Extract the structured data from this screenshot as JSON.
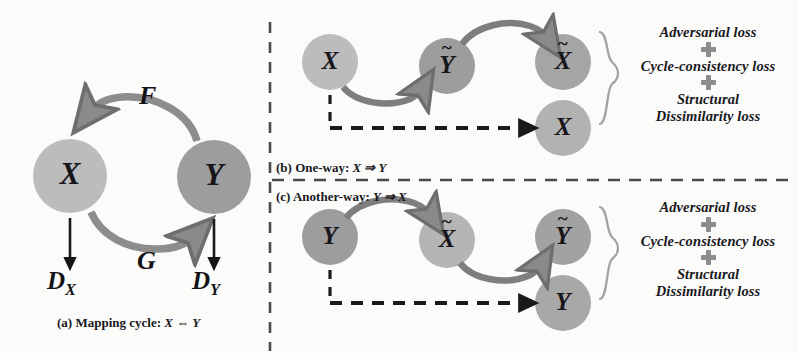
{
  "figure": {
    "background": "#fbfbfa",
    "colors": {
      "node_light": "#b9b9b9",
      "node_dark": "#9a9a9a",
      "arrow_gray": "#8a8a8a",
      "arrow_dark": "#6f6f6f",
      "text": "#18181c",
      "dash_black": "#1a1a1a",
      "plus_gray": "#8c8c8c",
      "brace_gray": "#9c9c9c"
    }
  },
  "panel_a": {
    "caption": "(a) Mapping cycle: ",
    "caption_math": "X ⇔ Y",
    "nodes": [
      {
        "id": "a-x",
        "label": "X",
        "tone": "light",
        "cx": 70,
        "cy": 176,
        "r": 37
      },
      {
        "id": "a-y",
        "label": "Y",
        "tone": "dark",
        "cx": 214,
        "cy": 177,
        "r": 37
      }
    ],
    "mappings": [
      {
        "id": "F",
        "label": "F",
        "direction": "X → Y (top arc, right to left arrowhead)"
      },
      {
        "id": "G",
        "label": "G",
        "direction": "Y → X (bottom arc, left to right arrowhead)"
      }
    ],
    "discriminators": [
      {
        "id": "d-x",
        "label": "D",
        "sub": "X"
      },
      {
        "id": "d-y",
        "label": "D",
        "sub": "Y"
      }
    ]
  },
  "panel_b": {
    "caption_prefix": "(b) One-way: ",
    "caption_math": "X ⇒ Y",
    "nodes": [
      {
        "id": "b-x",
        "label": "X",
        "tilde": false,
        "tone": "light",
        "cx": 330,
        "cy": 62,
        "r": 28
      },
      {
        "id": "b-ytilde",
        "label": "Y",
        "tilde": true,
        "tone": "dark",
        "cx": 447,
        "cy": 66,
        "r": 28
      },
      {
        "id": "b-xtilde",
        "label": "X",
        "tilde": true,
        "tone": "dark",
        "cx": 563,
        "cy": 62,
        "r": 28
      },
      {
        "id": "b-xreal",
        "label": "X",
        "tilde": false,
        "tone": "light",
        "cx": 563,
        "cy": 128,
        "r": 28
      }
    ],
    "edges": [
      {
        "from": "b-x",
        "to": "b-ytilde",
        "style": "solid-arc-below"
      },
      {
        "from": "b-ytilde",
        "to": "b-xtilde",
        "style": "solid-arc-above"
      },
      {
        "from": "b-x",
        "to": "b-xreal",
        "style": "dashed-elbow"
      }
    ],
    "losses": [
      "Adversarial loss",
      "Cycle-consistency loss",
      "Structural",
      "Dissimilarity loss"
    ],
    "plus_count": 2
  },
  "panel_c": {
    "caption_prefix": "(c) Another-way: ",
    "caption_math": "Y ⇒ X",
    "nodes": [
      {
        "id": "c-y",
        "label": "Y",
        "tilde": false,
        "tone": "dark",
        "cx": 330,
        "cy": 237,
        "r": 28
      },
      {
        "id": "c-xtilde",
        "label": "X",
        "tilde": true,
        "tone": "light",
        "cx": 447,
        "cy": 240,
        "r": 28
      },
      {
        "id": "c-ytilde",
        "label": "Y",
        "tilde": true,
        "tone": "dark",
        "cx": 563,
        "cy": 237,
        "r": 28
      },
      {
        "id": "c-yreal",
        "label": "Y",
        "tilde": false,
        "tone": "dark",
        "cx": 563,
        "cy": 303,
        "r": 28
      }
    ],
    "edges": [
      {
        "from": "c-y",
        "to": "c-xtilde",
        "style": "solid-arc-above"
      },
      {
        "from": "c-xtilde",
        "to": "c-ytilde",
        "style": "solid-arc-below"
      },
      {
        "from": "c-y",
        "to": "c-yreal",
        "style": "dashed-elbow"
      }
    ],
    "losses": [
      "Adversarial loss",
      "Cycle-consistency loss",
      "Structural",
      "Dissimilarity loss"
    ],
    "plus_count": 2
  },
  "dividers": {
    "vertical_label": "vertical dashed divider between panel (a) and panels (b)/(c)",
    "horizontal_label": "horizontal dashed divider between panel (b) and panel (c)"
  }
}
